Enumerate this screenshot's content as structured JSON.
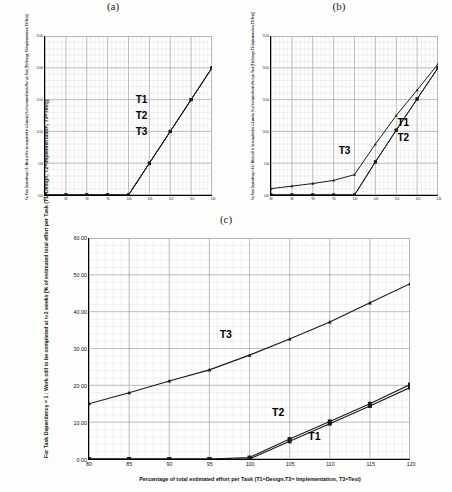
{
  "figure": {
    "panel_labels": [
      "(a)",
      "(b)",
      "(c)"
    ],
    "x_tick_labels": [
      "80",
      "85",
      "90",
      "95",
      "100",
      "105",
      "110",
      "115",
      "120"
    ],
    "x_axis_caption": "Percentage of total estimated effort per Task (T1=Design,T2= Implementation, T3=Test)",
    "series_names": [
      "T1",
      "T2",
      "T3"
    ],
    "line_color": "#1a1a1a",
    "grid_color": "#a8a8a8",
    "minor_grid_color": "#d8d8d8",
    "plot_background": "#ffffff"
  },
  "chart_data": [
    {
      "type": "line",
      "title": "(a)",
      "xlabel": "Percentage of total estimated effort per Task (T1=Design,T2= Implementation, T3=Test)",
      "ylabel": "For Task Dependency = 0 : Work still to be completed at t+2 weeks [% of estimated total effort per Task (T1=Design, T2=Implementation, T3=Test)]",
      "x": [
        80,
        85,
        90,
        95,
        100,
        105,
        110,
        115,
        120
      ],
      "xlim": [
        80,
        120
      ],
      "ylim": [
        0,
        25
      ],
      "y_tick_labels": [
        "0.00",
        "5.00",
        "10.00",
        "15.00",
        "20.00",
        "25.00"
      ],
      "y_ticks": [
        0,
        5,
        10,
        15,
        20,
        25
      ],
      "grid": true,
      "legend": "inline-labels",
      "series": [
        {
          "name": "T1",
          "values": [
            0,
            0,
            0,
            0,
            0,
            5,
            10,
            15,
            20
          ]
        },
        {
          "name": "T2",
          "values": [
            0,
            0,
            0,
            0,
            0,
            5,
            10,
            15,
            20
          ]
        },
        {
          "name": "T3",
          "values": [
            0,
            0,
            0,
            0,
            0,
            5,
            10,
            15,
            20
          ]
        }
      ],
      "annotations": [
        {
          "text": "T1",
          "x": 103,
          "y": 15.2
        },
        {
          "text": "T2",
          "x": 103,
          "y": 12.6
        },
        {
          "text": "T3",
          "x": 103,
          "y": 10.1
        }
      ]
    },
    {
      "type": "line",
      "title": "(b)",
      "xlabel": "Percentage of total estimated effort per Task (T1=Design,T2= Implementation, T3=Test)",
      "ylabel": "For Task Dependency = 0.5 : Work still to be completed at t+2 weeks [% of estimated total effort per Task (T1=Design, T2=Implementation, T3=Test)]",
      "x": [
        80,
        85,
        90,
        95,
        100,
        105,
        110,
        115,
        120
      ],
      "xlim": [
        80,
        120
      ],
      "ylim": [
        0,
        25
      ],
      "y_tick_labels": [
        "0.00",
        "5.00",
        "10.00",
        "15.00",
        "20.00",
        "25.00"
      ],
      "y_ticks": [
        0,
        5,
        10,
        15,
        20,
        25
      ],
      "grid": true,
      "legend": "inline-labels",
      "series": [
        {
          "name": "T1",
          "values": [
            0,
            0,
            0,
            0,
            0,
            5.2,
            10.2,
            15.1,
            20.0
          ]
        },
        {
          "name": "T2",
          "values": [
            0,
            0,
            0,
            0,
            0,
            5.2,
            10.2,
            15.1,
            20.0
          ]
        },
        {
          "name": "T3",
          "values": [
            1.0,
            1.4,
            1.8,
            2.3,
            3.2,
            8.0,
            12.5,
            16.5,
            20.6
          ]
        }
      ],
      "annotations": [
        {
          "text": "T3",
          "x": 97.5,
          "y": 7.2
        },
        {
          "text": "T1",
          "x": 111.5,
          "y": 11.6
        },
        {
          "text": "T2",
          "x": 111.5,
          "y": 9.2
        }
      ]
    },
    {
      "type": "line",
      "title": "(c)",
      "xlabel": "Percentage of total estimated effort per Task (T1=Design,T2= Implementation, T3=Test)",
      "ylabel": "For Task Dependency = 1 : Work still to be completed at t+2 weeks [% of estimated total effort per Task (T1=Design, T2=Implementation, T3=Test)]",
      "x": [
        80,
        85,
        90,
        95,
        100,
        105,
        110,
        115,
        120
      ],
      "xlim": [
        80,
        120
      ],
      "ylim": [
        0,
        60
      ],
      "y_tick_labels": [
        "0.00",
        "10.00",
        "20.00",
        "30.00",
        "40.00",
        "50.00",
        "60.00"
      ],
      "y_ticks": [
        0,
        10,
        20,
        30,
        40,
        50,
        60
      ],
      "grid": true,
      "legend": "inline-labels",
      "series": [
        {
          "name": "T1",
          "values": [
            0,
            0,
            0,
            0,
            0,
            4.8,
            9.6,
            14.4,
            19.4
          ]
        },
        {
          "name": "T2",
          "values": [
            0,
            0,
            0,
            0,
            0.4,
            5.4,
            10.2,
            15.0,
            20.2
          ]
        },
        {
          "name": "T3",
          "values": [
            15.0,
            18.0,
            21.2,
            24.2,
            28.2,
            32.6,
            37.2,
            42.4,
            47.6
          ]
        }
      ],
      "annotations": [
        {
          "text": "T3",
          "x": 97.0,
          "y": 34.0
        },
        {
          "text": "T2",
          "x": 103.5,
          "y": 13.0
        },
        {
          "text": "T1",
          "x": 108.0,
          "y": 6.5
        }
      ]
    }
  ]
}
